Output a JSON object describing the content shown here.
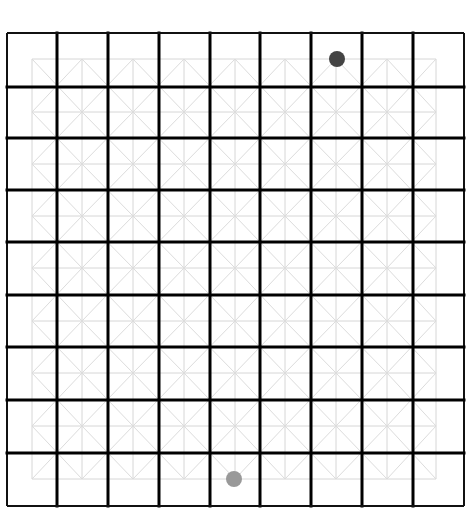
{
  "board": {
    "columns": 9,
    "rows": 9,
    "col_lines_x": [
      7,
      57,
      108,
      159,
      210,
      260,
      311,
      362,
      413,
      464
    ],
    "row_lines_y": [
      33,
      87,
      138,
      190,
      242,
      295,
      347,
      400,
      453,
      506
    ],
    "light_grid": {
      "x": [
        32,
        82,
        133,
        184,
        235,
        285,
        336,
        387,
        436
      ],
      "y": [
        59,
        112,
        164,
        216,
        268,
        321,
        373,
        426,
        479
      ]
    },
    "colors": {
      "background": "#ffffff",
      "thick_line": "#000000",
      "light_line": "#d6d6d6"
    }
  },
  "pieces": [
    {
      "id": "dark-pawn",
      "name": "opponent-pawn",
      "col": 6,
      "row": 0,
      "cx": 337,
      "cy": 59,
      "r": 8,
      "color": "#444444"
    },
    {
      "id": "light-pawn",
      "name": "player-pawn",
      "col": 4,
      "row": 8,
      "cx": 234,
      "cy": 479,
      "r": 8,
      "color": "#999999"
    }
  ]
}
